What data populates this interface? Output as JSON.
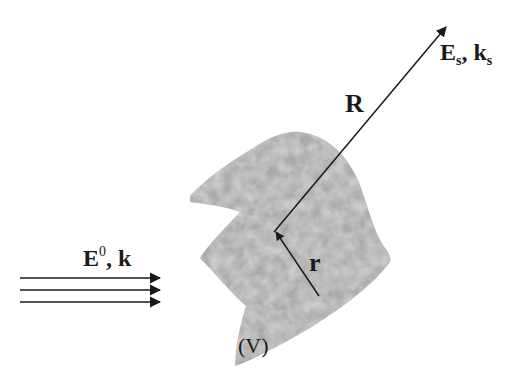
{
  "figure": {
    "colors": {
      "line": "#1a1a1a",
      "body_fill": "#a8a8a8",
      "background": "#ffffff"
    }
  },
  "labels": {
    "incident_field": {
      "main": "E",
      "sup": "0",
      "sep": ", ",
      "wavevector": "k"
    },
    "scattered_field": {
      "main": "E",
      "sub1": "s",
      "sep": ", ",
      "wavevector": "k",
      "sub2": "s"
    },
    "observation_vector": "R",
    "source_vector": "r",
    "volume": "(V)"
  },
  "incident_arrows": {
    "count": 3
  }
}
